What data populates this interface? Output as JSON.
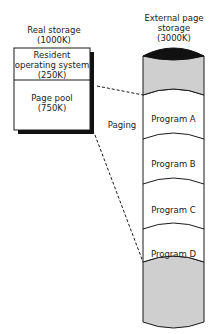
{
  "real_storage": {
    "title": "Real storage",
    "size": "(1000K)",
    "regions": [
      {
        "name": "Resident",
        "line2": "operating system",
        "size": "(250K)"
      },
      {
        "name": "Page pool",
        "size": "(750K)"
      }
    ]
  },
  "external_storage": {
    "title": "External page",
    "title_line2": "storage",
    "size": "(3000K)",
    "programs": [
      "Program A",
      "Program B",
      "Program C",
      "Program D"
    ]
  },
  "connector_label": "Paging",
  "colors": {
    "outline": "#1a1a1a",
    "fill_gray": "#cfcfcf",
    "cap_dark": "#111111",
    "shadow": "#111111"
  }
}
